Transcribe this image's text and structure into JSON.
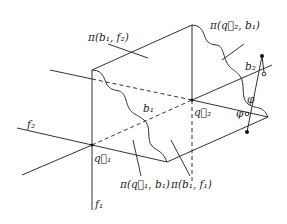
{
  "diagram": {
    "labels": {
      "pi_b1_f2": "π(b₁, f₂)",
      "pi_q2_b1": "π(q⃗₂, b₁)",
      "pi_q1_b1": "π(q⃗₁, b₁)",
      "pi_b1_f1": "π(b₁, f₁)",
      "b1": "b₁",
      "b2": "b₂",
      "q1": "q⃗₁",
      "q2": "q⃗₂",
      "f1": "f₁",
      "f2": "f₂",
      "phi_upper": "φ",
      "phi_lower": "φ"
    }
  }
}
